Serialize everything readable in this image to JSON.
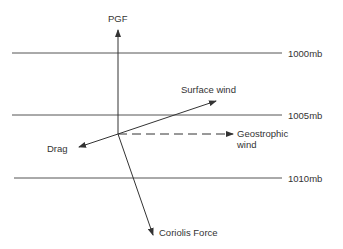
{
  "diagram": {
    "vectors": {
      "pgf": "PGF",
      "surface_wind": "Surface wind",
      "drag": "Drag",
      "geostrophic_line1": "Geostrophic",
      "geostrophic_line2": "wind",
      "coriolis": "Coriolis Force"
    },
    "isobars": [
      {
        "label": "1000mb"
      },
      {
        "label": "1005mb"
      },
      {
        "label": "1010mb"
      }
    ],
    "colors": {
      "line": "#333333",
      "background": "#ffffff"
    }
  }
}
